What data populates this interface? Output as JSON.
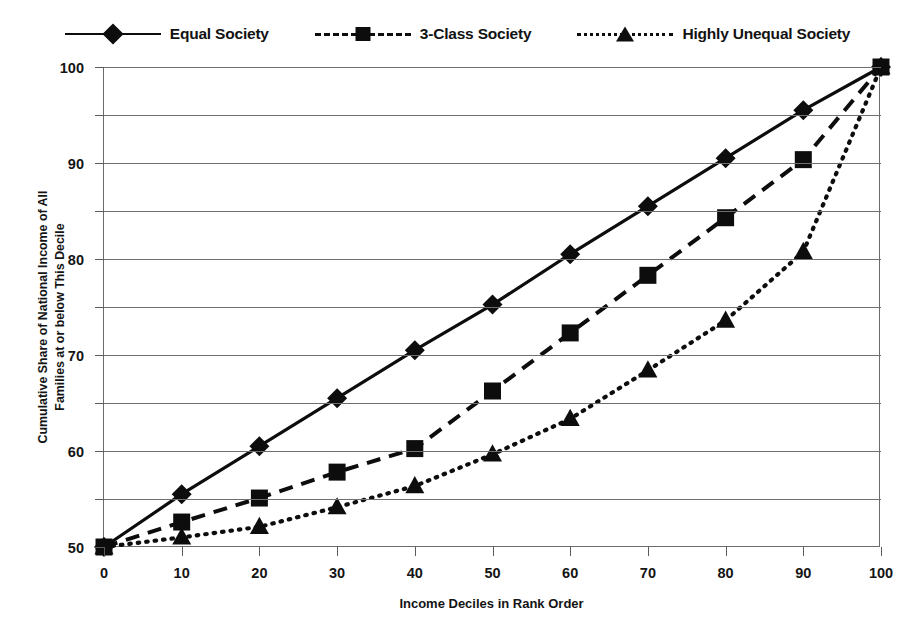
{
  "chart_data": {
    "type": "line",
    "title": "",
    "xlabel": "Income Deciles in Rank Order",
    "ylabel": "Cumulative Share of National Income of All Families at or below This Decile",
    "ylabel_line1": "Cumulative Share of National Income of All",
    "ylabel_line2": "Families at or below This Decile",
    "x": [
      0,
      10,
      20,
      30,
      40,
      50,
      60,
      70,
      80,
      90,
      100
    ],
    "xlim": [
      0,
      100
    ],
    "ylim": [
      0,
      100
    ],
    "xticks": [
      "0",
      "10",
      "20",
      "30",
      "40",
      "50",
      "60",
      "70",
      "80",
      "90",
      "100"
    ],
    "yticks": [
      "0",
      "10",
      "20",
      "30",
      "40",
      "50",
      "60",
      "70",
      "80",
      "90",
      "100"
    ],
    "grid": "horizontal",
    "legend_position": "top-center",
    "series": [
      {
        "name": "Equal Society",
        "marker": "diamond",
        "linestyle": "solid",
        "color": "#0d0d0d",
        "values": [
          0,
          11,
          21,
          31,
          41,
          50.5,
          61,
          71,
          81,
          91,
          100
        ]
      },
      {
        "name": "3-Class Society",
        "marker": "square",
        "linestyle": "dashed",
        "color": "#0d0d0d",
        "values": [
          0,
          5.2,
          10.2,
          15.6,
          20.5,
          32.5,
          44.6,
          56.6,
          68.6,
          80.7,
          100
        ]
      },
      {
        "name": "Highly Unequal Society",
        "marker": "triangle",
        "linestyle": "dotted",
        "color": "#0d0d0d",
        "values": [
          0,
          2.0,
          4.2,
          8.3,
          12.7,
          19.3,
          26.7,
          36.8,
          47.2,
          61.5,
          100
        ]
      }
    ]
  },
  "legend": {
    "items": [
      {
        "label": "Equal Society",
        "marker": "diamond",
        "linestyle": "solid"
      },
      {
        "label": "3-Class Society",
        "marker": "square",
        "linestyle": "dashed"
      },
      {
        "label": "Highly Unequal Society",
        "marker": "triangle",
        "linestyle": "dotted"
      }
    ]
  },
  "colors": {
    "ink": "#0d0d0d",
    "grid": "#6f6f6f",
    "axis": "#6b6b6b",
    "background": "#ffffff"
  }
}
